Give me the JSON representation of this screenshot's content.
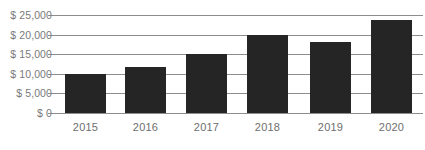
{
  "chart_data": {
    "type": "bar",
    "title": "",
    "subtitle": "",
    "xlabel": "",
    "ylabel": "",
    "categories": [
      "2015",
      "2016",
      "2017",
      "2018",
      "2019",
      "2020"
    ],
    "values": [
      10000,
      11700,
      15000,
      20000,
      18000,
      23800
    ],
    "series": [
      {
        "name": "",
        "values": [
          10000,
          11700,
          15000,
          20000,
          18000,
          23800
        ]
      }
    ],
    "ylim": [
      0,
      25000
    ],
    "y_ticks": [
      0,
      5000,
      10000,
      15000,
      20000,
      25000
    ],
    "y_tick_labels": [
      "$ 0",
      "$ 5,000",
      "$ 10,000",
      "$ 15,000",
      "$ 20,000",
      "$ 25,000"
    ],
    "x_tick_labels": [
      "2015",
      "2016",
      "2017",
      "2018",
      "2019",
      "2020"
    ],
    "grid": "horizontal",
    "legend": "none",
    "bar_color": "#252525",
    "grid_color": "#8d8d8d",
    "label_color": "#7a7a7a",
    "background_color": "#ffffff"
  },
  "axis": {
    "y": {
      "t25000": "$ 25,000",
      "t20000": "$ 20,000",
      "t15000": "$ 15,000",
      "t10000": "$ 10,000",
      "t5000": "$ 5,000",
      "t0": "$ 0"
    },
    "x": {
      "c0": "2015",
      "c1": "2016",
      "c2": "2017",
      "c3": "2018",
      "c4": "2019",
      "c5": "2020"
    }
  }
}
